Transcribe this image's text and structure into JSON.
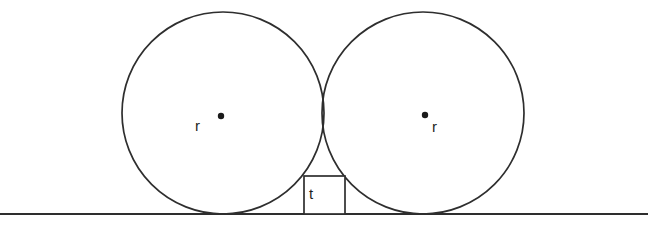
{
  "figure": {
    "kind": "geometry-diagram",
    "background_color": "#ffffff",
    "stroke_color": "#2e2e2e",
    "label_color": "#1f1f1f"
  },
  "ground_line": {
    "name": "ground-line",
    "x1": 0,
    "y1": 214,
    "x2": 648,
    "y2": 214,
    "stroke_width": 2.1
  },
  "circles": [
    {
      "name": "left-circle",
      "cx": 223,
      "cy": 113,
      "r": 101,
      "label": "r",
      "label_x": 195,
      "label_y": 131,
      "dot_x": 221,
      "dot_y": 116,
      "dot_r": 3.2
    },
    {
      "name": "right-circle",
      "cx": 423,
      "cy": 113,
      "r": 101,
      "label": "r",
      "label_x": 432,
      "label_y": 132,
      "dot_x": 425,
      "dot_y": 115,
      "dot_r": 3.2
    }
  ],
  "square": {
    "name": "gap-square",
    "label": "t",
    "x": 304,
    "y": 176,
    "width": 41,
    "height": 38,
    "label_x": 309,
    "label_y": 199
  }
}
